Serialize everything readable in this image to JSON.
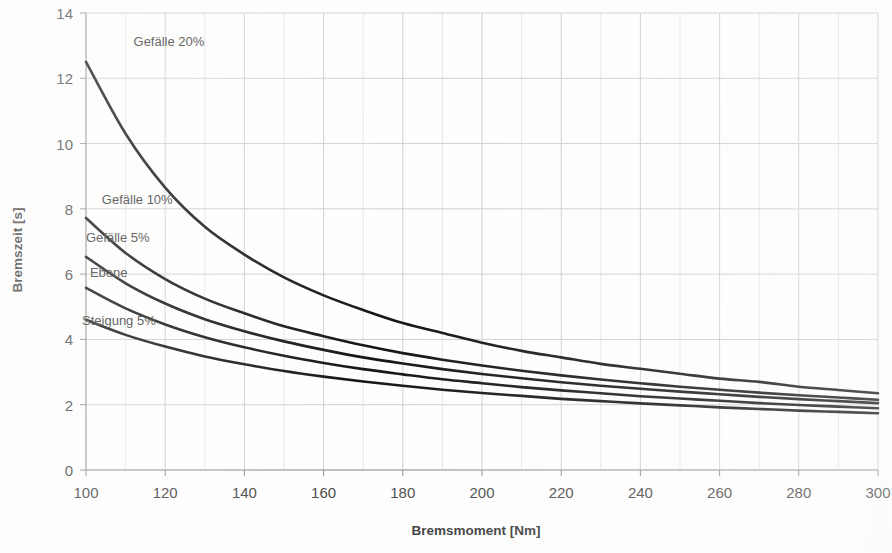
{
  "chart_data": {
    "type": "line",
    "title": "",
    "xlabel": "Bremsmoment [Nm]",
    "ylabel": "Bremszeit [s]",
    "xlim": [
      100,
      300
    ],
    "ylim": [
      0,
      14
    ],
    "xticks": [
      100,
      120,
      140,
      160,
      180,
      200,
      220,
      240,
      260,
      280,
      300
    ],
    "xtick_labels": [
      "100",
      "120",
      "140",
      "160",
      "180",
      "200",
      "220",
      "240",
      "260",
      "280",
      "300"
    ],
    "yticks": [
      0,
      2,
      4,
      6,
      8,
      10,
      12,
      14
    ],
    "ytick_labels": [
      "0",
      "2",
      "4",
      "6",
      "8",
      "10",
      "12",
      "14"
    ],
    "x_minor_step": 10,
    "grid": true,
    "grid_axes": "both",
    "legend_position": "inline-labels",
    "x": [
      100,
      110,
      120,
      130,
      140,
      150,
      160,
      170,
      180,
      190,
      200,
      210,
      220,
      230,
      240,
      250,
      260,
      270,
      280,
      290,
      300
    ],
    "series": [
      {
        "name": "Gefälle 20%",
        "label": "Gefälle 20%",
        "color": "#161616",
        "label_x": 112,
        "label_y": 13.0,
        "values": [
          12.5,
          10.3,
          8.65,
          7.45,
          6.6,
          5.9,
          5.35,
          4.9,
          4.5,
          4.2,
          3.9,
          3.65,
          3.45,
          3.25,
          3.1,
          2.95,
          2.8,
          2.7,
          2.55,
          2.45,
          2.35
        ]
      },
      {
        "name": "Gefälle 10%",
        "label": "Gefälle 10%",
        "color": "#161616",
        "label_x": 104,
        "label_y": 8.15,
        "values": [
          7.72,
          6.65,
          5.85,
          5.25,
          4.8,
          4.4,
          4.1,
          3.82,
          3.58,
          3.38,
          3.2,
          3.04,
          2.9,
          2.77,
          2.66,
          2.55,
          2.46,
          2.37,
          2.29,
          2.22,
          2.15
        ]
      },
      {
        "name": "Gefälle 5%",
        "label": "Gefälle 5%",
        "color": "#161616",
        "label_x": 100,
        "label_y": 7.0,
        "values": [
          6.53,
          5.72,
          5.1,
          4.62,
          4.25,
          3.94,
          3.68,
          3.45,
          3.26,
          3.09,
          2.94,
          2.81,
          2.69,
          2.58,
          2.49,
          2.4,
          2.32,
          2.24,
          2.17,
          2.11,
          2.05
        ]
      },
      {
        "name": "Ebene",
        "label": "Ebene",
        "color": "#161616",
        "label_x": 101,
        "label_y": 5.9,
        "values": [
          5.58,
          4.95,
          4.46,
          4.07,
          3.76,
          3.5,
          3.28,
          3.09,
          2.93,
          2.78,
          2.66,
          2.54,
          2.44,
          2.35,
          2.26,
          2.19,
          2.12,
          2.05,
          1.99,
          1.94,
          1.89
        ]
      },
      {
        "name": "Steigung 5%",
        "label": "Steigung 5%",
        "color": "#161616",
        "label_x": 99,
        "label_y": 4.45,
        "values": [
          4.6,
          4.14,
          3.78,
          3.48,
          3.24,
          3.03,
          2.86,
          2.71,
          2.58,
          2.46,
          2.36,
          2.27,
          2.18,
          2.11,
          2.04,
          1.98,
          1.92,
          1.87,
          1.82,
          1.78,
          1.74
        ]
      }
    ]
  }
}
